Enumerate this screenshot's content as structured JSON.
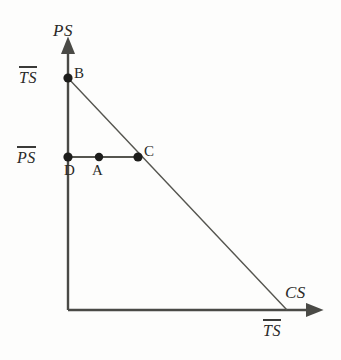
{
  "figure": {
    "type": "economics-diagram",
    "background_color": "#fdfdfc",
    "line_color": "#4a4a46",
    "text_color": "#2a2a28"
  },
  "axes": {
    "y_axis": {
      "label": "PS",
      "name": "producer-surplus-axis",
      "origin": {
        "x": 68,
        "y": 310
      },
      "tip": {
        "x": 68,
        "y": 45
      }
    },
    "x_axis": {
      "label": "CS",
      "name": "consumer-surplus-axis",
      "origin": {
        "x": 68,
        "y": 310
      },
      "tip": {
        "x": 315,
        "y": 310
      }
    }
  },
  "tick_labels": {
    "y_top": "TS",
    "y_mid": "PS",
    "x_right": "TS"
  },
  "points": [
    {
      "id": "B",
      "label": "B",
      "x": 68,
      "y": 78
    },
    {
      "id": "D",
      "label": "D",
      "x": 68,
      "y": 157
    },
    {
      "id": "A",
      "label": "A",
      "x": 99,
      "y": 157
    },
    {
      "id": "C",
      "label": "C",
      "x": 138,
      "y": 157
    }
  ],
  "lines": [
    {
      "name": "budget-frontier",
      "from": {
        "x": 68,
        "y": 78
      },
      "to": {
        "x": 287,
        "y": 310
      }
    },
    {
      "name": "ps-level-segment",
      "from": {
        "x": 68,
        "y": 157
      },
      "to": {
        "x": 138,
        "y": 157
      }
    }
  ],
  "chart_data": {
    "type": "scatter",
    "title": "",
    "xlabel": "CS",
    "ylabel": "PS",
    "grid": false,
    "legend": null,
    "annotations": [
      {
        "text": "B",
        "x": 0,
        "y": 1.0,
        "note": "intercept of frontier on PS axis at TS-bar"
      },
      {
        "text": "D",
        "x": 0,
        "y": 0.66,
        "note": "on PS axis at PS-bar"
      },
      {
        "text": "A",
        "x": 0.14,
        "y": 0.66,
        "note": "interior point on PS-bar level"
      },
      {
        "text": "C",
        "x": 0.32,
        "y": 0.66,
        "note": "on frontier at PS-bar level"
      }
    ],
    "series": [
      {
        "name": "frontier",
        "type": "line",
        "x": [
          0,
          1.0
        ],
        "y": [
          1.0,
          0
        ]
      },
      {
        "name": "ps-bar-level",
        "type": "line",
        "x": [
          0,
          0.32
        ],
        "y": [
          0.66,
          0.66
        ]
      },
      {
        "name": "points",
        "type": "scatter",
        "x": [
          0,
          0,
          0.14,
          0.32
        ],
        "y": [
          1.0,
          0.66,
          0.66,
          0.66
        ],
        "labels": [
          "B",
          "D",
          "A",
          "C"
        ]
      }
    ],
    "axis_tick_labels": {
      "y": [
        "PS̅",
        "TS̅"
      ],
      "x": [
        "TS̅"
      ]
    },
    "xlim": [
      0,
      1.13
    ],
    "ylim": [
      0,
      1.14
    ]
  }
}
